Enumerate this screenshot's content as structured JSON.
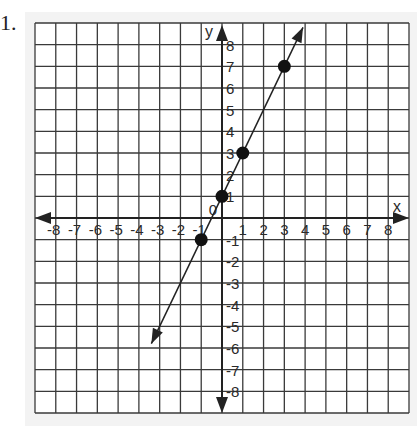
{
  "problem": {
    "number": "1."
  },
  "chart_data": {
    "type": "line",
    "title": "",
    "xlabel": "x",
    "ylabel": "y",
    "origin_label": "0",
    "xlim": [
      -9,
      9
    ],
    "ylim": [
      -9,
      9
    ],
    "grid": true,
    "x_ticks": [
      -8,
      -7,
      -6,
      -5,
      -4,
      -3,
      -2,
      -1,
      1,
      2,
      3,
      4,
      5,
      6,
      7,
      8
    ],
    "y_ticks": [
      -8,
      -7,
      -6,
      -5,
      -4,
      -3,
      -2,
      -1,
      1,
      2,
      3,
      4,
      5,
      6,
      7,
      8
    ],
    "series": [
      {
        "name": "y = 2x + 1",
        "points": [
          {
            "x": -1,
            "y": -1
          },
          {
            "x": 0,
            "y": 1
          },
          {
            "x": 1,
            "y": 3
          },
          {
            "x": 3,
            "y": 7
          }
        ],
        "line_extent": {
          "start": {
            "x": -3.4,
            "y": -5.8
          },
          "end": {
            "x": 3.9,
            "y": 8.8
          }
        },
        "arrows_both_ends": true
      }
    ],
    "colors": {
      "grid": "#3a3a3a",
      "axis": "#222222",
      "points": "#111111",
      "background": "#ffffff",
      "panel": "#f3f3f3"
    }
  }
}
